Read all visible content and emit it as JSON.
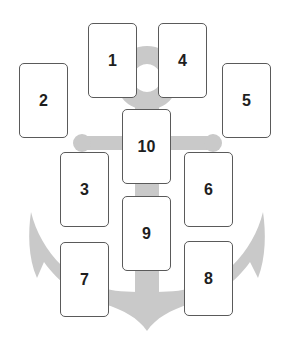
{
  "diagram": {
    "title": "",
    "background_shape": "anchor",
    "colors": {
      "anchor": "#c9c9c9",
      "card_border": "#5a5a5a",
      "card_fill": "#ffffff",
      "number": "#1e1e1e"
    },
    "cards": [
      {
        "number": "1",
        "x": 88,
        "y": 23
      },
      {
        "number": "2",
        "x": 19,
        "y": 63
      },
      {
        "number": "3",
        "x": 60,
        "y": 152
      },
      {
        "number": "4",
        "x": 158,
        "y": 23
      },
      {
        "number": "5",
        "x": 222,
        "y": 63
      },
      {
        "number": "6",
        "x": 184,
        "y": 152
      },
      {
        "number": "7",
        "x": 60,
        "y": 242
      },
      {
        "number": "8",
        "x": 184,
        "y": 241
      },
      {
        "number": "9",
        "x": 122,
        "y": 196
      },
      {
        "number": "10",
        "x": 122,
        "y": 109
      }
    ]
  }
}
